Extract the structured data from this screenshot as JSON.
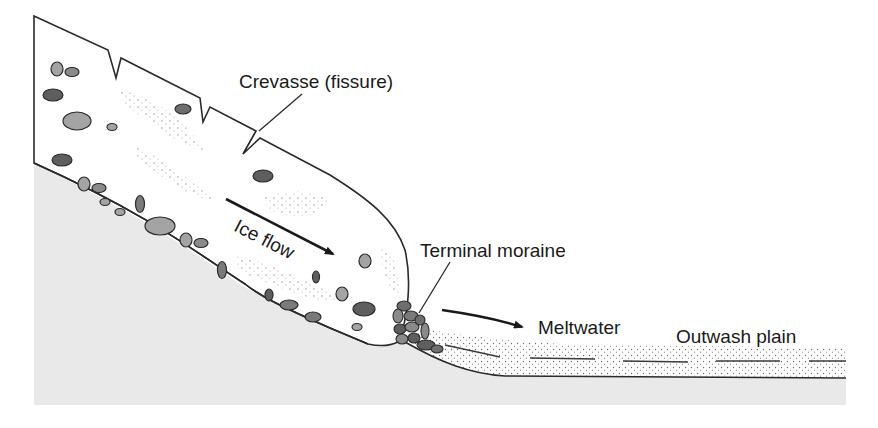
{
  "diagram": {
    "type": "cross-section",
    "labels": {
      "crevasse": "Crevasse (fissure)",
      "ice_flow": "Ice flow",
      "terminal_moraine": "Terminal moraine",
      "meltwater": "Meltwater",
      "outwash_plain": "Outwash plain"
    },
    "colors": {
      "ground": "#e9e9e9",
      "ice": "#ffffff",
      "outline": "#2a2a2a",
      "rock_dark": "#5e5e5e",
      "rock_mid": "#8a8a8a",
      "rock_light": "#a4a4a4",
      "sediment_dots": "#777777"
    }
  }
}
